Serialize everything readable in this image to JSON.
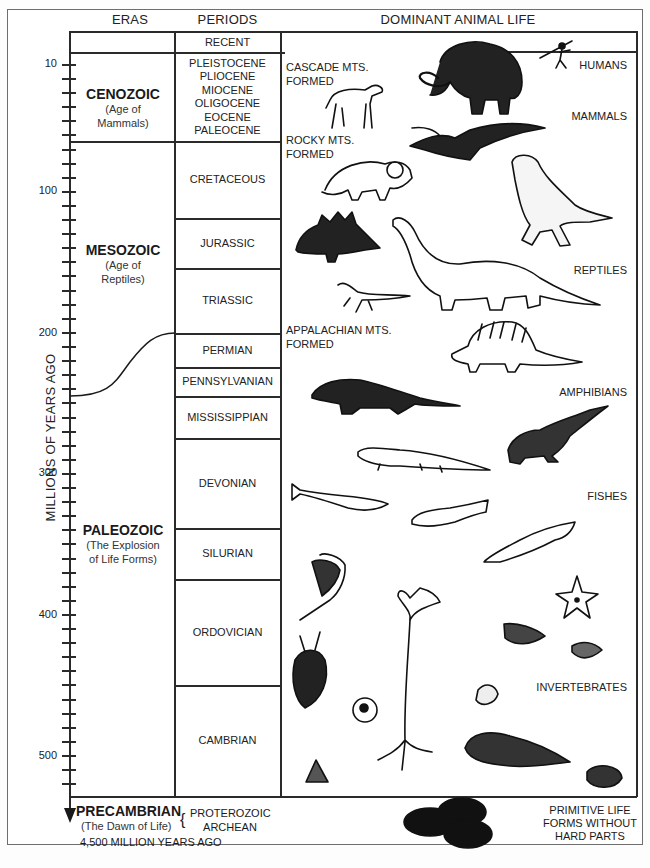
{
  "headers": {
    "eras": "ERAS",
    "periods": "PERIODS",
    "life": "DOMINANT ANIMAL LIFE"
  },
  "axis": {
    "label": "MILLIONS OF YEARS AGO",
    "ticks": [
      "10",
      "100",
      "200",
      "300",
      "400",
      "500"
    ],
    "bottom_label": "4,500 MILLION YEARS AGO"
  },
  "eras": [
    {
      "name": "CENOZOIC",
      "subtitle_1": "(Age of",
      "subtitle_2": "Mammals)"
    },
    {
      "name": "MESOZOIC",
      "subtitle_1": "(Age of",
      "subtitle_2": "Reptiles)"
    },
    {
      "name": "PALEOZOIC",
      "subtitle_1": "(The Explosion",
      "subtitle_2": "of Life Forms)"
    },
    {
      "name": "PRECAMBRIAN",
      "subtitle_1": "(The Dawn of Life)"
    }
  ],
  "periods": {
    "recent": "RECENT",
    "cenozoic_epochs": [
      "PLEISTOCENE",
      "PLIOCENE",
      "MIOCENE",
      "OLIGOCENE",
      "EOCENE",
      "PALEOCENE"
    ],
    "cretaceous": "CRETACEOUS",
    "jurassic": "JURASSIC",
    "triassic": "TRIASSIC",
    "permian": "PERMIAN",
    "pennsylvanian": "PENNSYLVANIAN",
    "mississippian": "MISSISSIPPIAN",
    "devonian": "DEVONIAN",
    "silurian": "SILURIAN",
    "ordovician": "ORDOVICIAN",
    "cambrian": "CAMBRIAN",
    "precambrian_1": "PROTEROZOIC",
    "precambrian_2": "ARCHEAN"
  },
  "events": [
    {
      "line1": "CASCADE MTS.",
      "line2": "FORMED"
    },
    {
      "line1": "ROCKY MTS.",
      "line2": "FORMED"
    },
    {
      "line1": "APPALACHIAN MTS.",
      "line2": "FORMED"
    }
  ],
  "life_groups": {
    "humans": "HUMANS",
    "mammals": "MAMMALS",
    "reptiles": "REPTILES",
    "amphibians": "AMPHIBIANS",
    "fishes": "FISHES",
    "invertebrates": "INVERTEBRATES",
    "primitive_1": "PRIMITIVE LIFE",
    "primitive_2": "FORMS WITHOUT",
    "primitive_3": "HARD PARTS"
  },
  "colors": {
    "ink": "#1a1a1a",
    "frame": "#6e6e6e",
    "paper": "#ffffff"
  }
}
